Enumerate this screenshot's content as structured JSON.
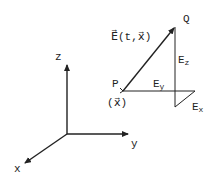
{
  "diagram": {
    "axes": {
      "x_label": "x",
      "y_label": "y",
      "z_label": "z"
    },
    "points": {
      "P_label": "P",
      "Q_label": "Q",
      "position_label": "(x⃗)"
    },
    "vector_label": "E⃗(t,x⃗)",
    "components": {
      "Ex": {
        "base": "E",
        "sub": "x"
      },
      "Ey": {
        "base": "E",
        "sub": "y"
      },
      "Ez": {
        "base": "E",
        "sub": "z"
      }
    },
    "colors": {
      "ink": "#222222",
      "background": "#ffffff"
    }
  }
}
